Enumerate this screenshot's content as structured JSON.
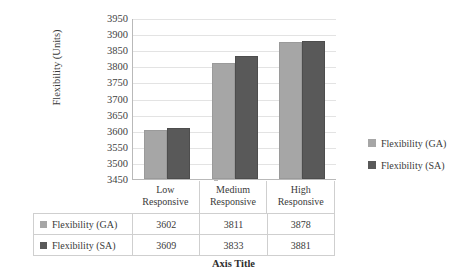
{
  "chart_data": {
    "type": "bar",
    "title": "",
    "subtitle": "",
    "xlabel": "Axis Title",
    "ylabel": "Flexibility (Units)",
    "categories": [
      "Low Responsive",
      "Medium Responsive",
      "High Responsive"
    ],
    "category_lines": [
      {
        "line1": "Low",
        "line2": "Responsive"
      },
      {
        "line1": "Medium",
        "line2": "Responsive"
      },
      {
        "line1": "High",
        "line2": "Responsive"
      }
    ],
    "series": [
      {
        "name": "Flexibility (GA)",
        "color": "#A6A6A6",
        "values": [
          3602,
          3811,
          3878
        ]
      },
      {
        "name": "Flexibility (SA)",
        "color": "#595959",
        "values": [
          3609,
          3833,
          3881
        ]
      }
    ],
    "ylim": [
      3450,
      3950
    ],
    "ytick_step": 50,
    "yticks": [
      3950,
      3900,
      3850,
      3800,
      3750,
      3700,
      3650,
      3600,
      3550,
      3500,
      3450
    ],
    "ytick_labels": [
      "3950",
      "3900",
      "3850",
      "3800",
      "3750",
      "3700",
      "3650",
      "3600",
      "3550",
      "3500",
      "3450"
    ],
    "grid": true,
    "grid_axis": "y",
    "legend_position": "right",
    "data_table_visible": true,
    "legend": [
      {
        "label": "Flexibility (GA)",
        "color": "#A6A6A6"
      },
      {
        "label": "Flexibility (SA)",
        "color": "#595959"
      }
    ]
  },
  "data_table": {
    "rows": [
      {
        "name": "Flexibility (GA)",
        "swatch": "#A6A6A6",
        "values": [
          "3602",
          "3811",
          "3878"
        ]
      },
      {
        "name": "Flexibility (SA)",
        "swatch": "#595959",
        "values": [
          "3609",
          "3833",
          "3881"
        ]
      }
    ]
  },
  "colors": {
    "series_ga": "#A6A6A6",
    "series_sa": "#595959",
    "gridline": "#E3E3E3",
    "axis": "#B9B9B9",
    "table_border": "#CFCFCF",
    "text": "#3A3A3A",
    "background": "#FFFFFF"
  }
}
